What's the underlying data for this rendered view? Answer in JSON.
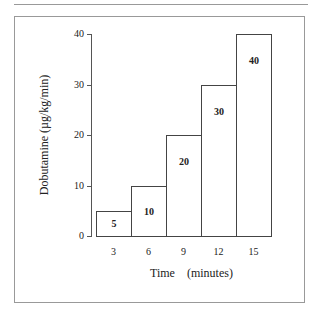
{
  "chart_data": {
    "type": "bar",
    "title": "",
    "xlabel": "Time    (minutes)",
    "ylabel": "Dobutamine (µg/kg/min)",
    "categories": [
      "3",
      "6",
      "9",
      "12",
      "15"
    ],
    "values": [
      5,
      10,
      20,
      30,
      40
    ],
    "bar_labels": [
      "5",
      "10",
      "20",
      "30",
      "40"
    ],
    "yticks": [
      "0",
      "10",
      "20",
      "30",
      "40"
    ],
    "ylim": [
      0,
      40
    ],
    "grid": false,
    "legend": null
  }
}
